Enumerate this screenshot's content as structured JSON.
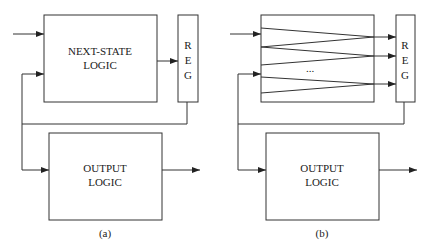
{
  "diagram": {
    "a": {
      "next_state": {
        "line1": "NEXT-STATE",
        "line2": "LOGIC"
      },
      "reg": {
        "r": "R",
        "e": "E",
        "g": "G"
      },
      "output": {
        "line1": "OUTPUT",
        "line2": "LOGIC"
      },
      "caption": "(a)"
    },
    "b": {
      "ellipsis": "...",
      "reg": {
        "r": "R",
        "e": "E",
        "g": "G"
      },
      "output": {
        "line1": "OUTPUT",
        "line2": "LOGIC"
      },
      "caption": "(b)"
    }
  },
  "colors": {
    "stroke": "#333333",
    "background": "#ffffff"
  }
}
